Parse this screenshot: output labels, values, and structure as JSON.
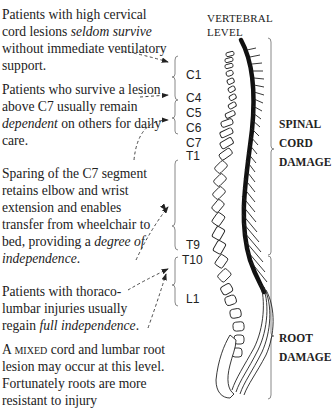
{
  "notes": [
    {
      "id": "high-cervical",
      "parts": [
        {
          "t": "Patients with high cervical cord lesions "
        },
        {
          "t": "seldom survive",
          "i": true
        },
        {
          "t": " without immediate ventilatory support."
        }
      ]
    },
    {
      "id": "above-c7",
      "parts": [
        {
          "t": "Patients who survive a lesion above C7 usually remain "
        },
        {
          "t": "dependent",
          "i": true
        },
        {
          "t": " on others for daily care."
        }
      ]
    },
    {
      "id": "c7-sparing",
      "parts": [
        {
          "t": "Sparing of the C7 segment retains elbow and wrist extension and enables transfer from wheelchair to bed, providing a "
        },
        {
          "t": "degree of independence",
          "i": true
        },
        {
          "t": "."
        }
      ]
    },
    {
      "id": "thoracolumbar",
      "parts": [
        {
          "t": "Patients with thoraco-lumbar injuries usually regain "
        },
        {
          "t": "full independence",
          "i": true
        },
        {
          "t": "."
        }
      ]
    },
    {
      "id": "mixed",
      "parts": [
        {
          "t": "A "
        },
        {
          "t": "mixed",
          "sc": true
        },
        {
          "t": " cord and lumbar root lesion may occur at this level. Fortunately roots are more resistant to injury"
        }
      ]
    }
  ],
  "header": {
    "line1": "VERTEBRAL",
    "line2": "LEVEL"
  },
  "levels": [
    {
      "label": "C1",
      "y": 76
    },
    {
      "label": "C4",
      "y": 99
    },
    {
      "label": "C5",
      "y": 114
    },
    {
      "label": "C6",
      "y": 129
    },
    {
      "label": "C7",
      "y": 144
    },
    {
      "label": "T1",
      "y": 157
    },
    {
      "label": "T9",
      "y": 246
    },
    {
      "label": "T10",
      "y": 261
    },
    {
      "label": "L1",
      "y": 300
    }
  ],
  "damage": {
    "spinal_cord": {
      "line1": "SPINAL",
      "line2": "CORD",
      "line3": "DAMAGE"
    },
    "root": {
      "line1": "ROOT",
      "line2": "DAMAGE"
    }
  },
  "colors": {
    "ink": "#222222",
    "brace": "#777777"
  }
}
